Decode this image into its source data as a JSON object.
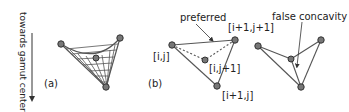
{
  "axis_label": "towards gamut center",
  "panels": {
    "a": {
      "label": "(a)"
    },
    "b": {
      "label": "(b)",
      "annotation": "preferred",
      "points": {
        "ij": "[i,j]",
        "i1j1": "[i+1,j+1]",
        "ij1": "[i,j+1]",
        "i1j": "[i+1,j]"
      }
    },
    "c": {
      "annotation": "false concavity"
    }
  },
  "colors": {
    "line": "#555555",
    "point_fill": "#777777",
    "point_stroke": "#333333",
    "text": "#222222"
  }
}
